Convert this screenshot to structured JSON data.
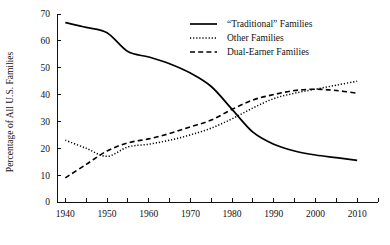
{
  "chart_data": {
    "type": "line",
    "title": "",
    "xlabel": "",
    "ylabel": "Percentage of All U.S. Families",
    "xlim": [
      1938,
      2015
    ],
    "ylim": [
      0,
      70
    ],
    "grid": false,
    "legend_position": "top-right",
    "x_ticks_major": [
      1940,
      1950,
      1960,
      1970,
      1980,
      1990,
      2000,
      2010
    ],
    "x_tick_labels": [
      "1940",
      "1950",
      "1960",
      "1970",
      "1980",
      "1990",
      "2000",
      "2010"
    ],
    "x_minor_tick_step": 5,
    "y_ticks": [
      0,
      10,
      20,
      30,
      40,
      50,
      60,
      70
    ],
    "y_tick_labels": [
      "0",
      "10",
      "20",
      "30",
      "40",
      "50",
      "60",
      "70"
    ],
    "series": [
      {
        "name": "“Traditional” Families",
        "style": "solid",
        "x": [
          1940,
          1945,
          1950,
          1955,
          1960,
          1965,
          1970,
          1975,
          1980,
          1985,
          1990,
          1995,
          2000,
          2005,
          2010
        ],
        "values": [
          66.8,
          65.0,
          63.0,
          56.0,
          54.0,
          51.5,
          48.0,
          43.0,
          34.5,
          26.0,
          21.5,
          19.0,
          17.5,
          16.5,
          15.5
        ]
      },
      {
        "name": "Other Families",
        "style": "dotted",
        "x": [
          1940,
          1945,
          1950,
          1955,
          1960,
          1965,
          1970,
          1975,
          1980,
          1985,
          1990,
          1995,
          2000,
          2005,
          2010
        ],
        "values": [
          23.0,
          20.0,
          17.0,
          20.5,
          21.5,
          23.0,
          25.0,
          27.5,
          31.0,
          35.0,
          38.5,
          40.5,
          42.0,
          43.5,
          45.0
        ]
      },
      {
        "name": "Dual-Earner Families",
        "style": "dashed",
        "x": [
          1940,
          1945,
          1950,
          1955,
          1960,
          1965,
          1970,
          1975,
          1980,
          1985,
          1990,
          1995,
          2000,
          2005,
          2010
        ],
        "values": [
          9.0,
          14.0,
          19.0,
          22.0,
          23.5,
          25.5,
          28.0,
          30.5,
          34.5,
          38.0,
          40.0,
          41.5,
          42.0,
          41.5,
          40.5
        ]
      }
    ]
  },
  "legend": {
    "items": [
      {
        "label": "“Traditional” Families",
        "style": "solid"
      },
      {
        "label": "Other Families",
        "style": "dotted"
      },
      {
        "label": "Dual-Earner Families",
        "style": "dashed"
      }
    ]
  }
}
